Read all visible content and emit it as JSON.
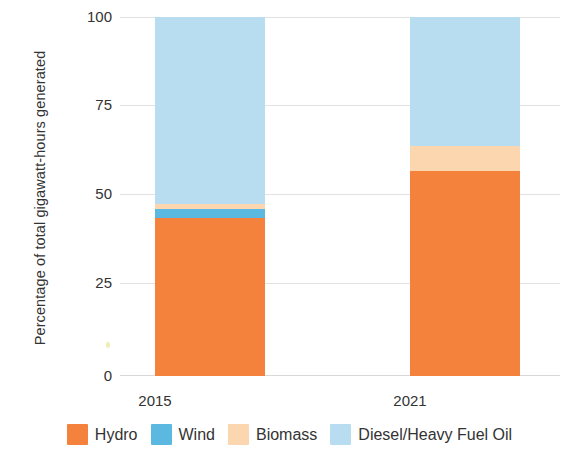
{
  "chart_data": {
    "type": "bar",
    "stacked": true,
    "normalized_percent": true,
    "title": "",
    "subtitle": "",
    "xlabel": "",
    "ylabel": "Percentage of total gigawatt-hours generated",
    "categories": [
      "2015",
      "2021"
    ],
    "ylim": [
      0,
      100
    ],
    "yticks": [
      0,
      25,
      50,
      75,
      100
    ],
    "ytick_labels": [
      "0",
      "25",
      "50",
      "75",
      "100"
    ],
    "grid": true,
    "grid_axis": "y",
    "legend_position": "bottom",
    "series": [
      {
        "name": "Hydro",
        "color": "#f4823c",
        "values": [
          44,
          57
        ]
      },
      {
        "name": "Wind",
        "color": "#5bb8e0",
        "values": [
          2.5,
          0
        ]
      },
      {
        "name": "Biomass",
        "color": "#fbd6ae",
        "values": [
          1.5,
          7
        ]
      },
      {
        "name": "Diesel/Heavy Fuel Oil",
        "color": "#b8dcf0",
        "values": [
          52,
          36
        ]
      }
    ]
  },
  "axis": {
    "y_title": "Percentage of total gigawatt-hours generated",
    "y_ticks": [
      "100",
      "75",
      "50",
      "25",
      "0"
    ],
    "x_ticks": [
      "2015",
      "2021"
    ]
  },
  "legend": {
    "items": [
      {
        "label": "Hydro",
        "color": "#f4823c"
      },
      {
        "label": "Wind",
        "color": "#5bb8e0"
      },
      {
        "label": "Biomass",
        "color": "#fbd6ae"
      },
      {
        "label": "Diesel/Heavy Fuel Oil",
        "color": "#b8dcf0"
      }
    ]
  }
}
